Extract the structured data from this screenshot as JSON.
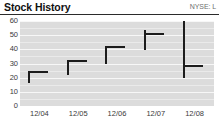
{
  "header": {
    "title": "Stock History",
    "ticker": "NYSE: L"
  },
  "colors": {
    "plot_background": "#dcdcdc",
    "gridline": "#f7f7f7",
    "mark": "#1c1c1c",
    "rule": "#2b2b2b",
    "axis_text": "#3a3a3a",
    "ticker_text": "#6e6e6e",
    "title_text": "#101010"
  },
  "chart_data": {
    "type": "bar",
    "title": "Stock History",
    "subtitle": "NYSE: L",
    "xlabel": "",
    "ylabel": "",
    "ylim": [
      0,
      60
    ],
    "yticks": [
      0,
      10,
      20,
      30,
      40,
      50,
      60
    ],
    "ytick_labels": [
      "0",
      "10",
      "20",
      "30",
      "40",
      "50",
      "60"
    ],
    "categories": [
      "12/04",
      "12/05",
      "12/06",
      "12/07",
      "12/08"
    ],
    "grid": true,
    "legend": "none",
    "series": [
      {
        "name": "Low",
        "values": [
          16,
          22,
          30,
          40,
          20
        ]
      },
      {
        "name": "High",
        "values": [
          24,
          32,
          42,
          54,
          60
        ]
      },
      {
        "name": "Close",
        "values": [
          24,
          32,
          42,
          51,
          28.5
        ]
      }
    ],
    "points": [
      {
        "category": "12/04",
        "low": 16,
        "high": 24,
        "close": 24
      },
      {
        "category": "12/05",
        "low": 22,
        "high": 32,
        "close": 32
      },
      {
        "category": "12/06",
        "low": 30,
        "high": 42,
        "close": 42
      },
      {
        "category": "12/07",
        "low": 40,
        "high": 54,
        "close": 51
      },
      {
        "category": "12/08",
        "low": 20,
        "high": 60,
        "close": 28.5
      }
    ]
  }
}
